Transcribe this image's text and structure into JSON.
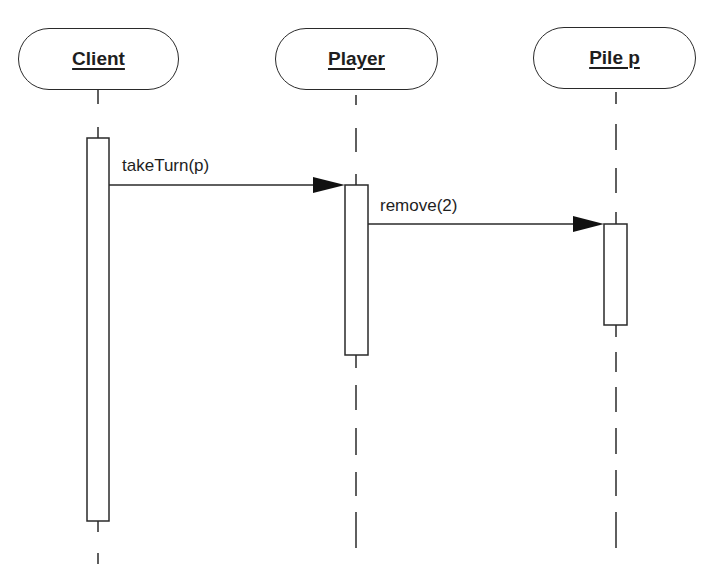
{
  "diagram": {
    "type": "uml-sequence-diagram",
    "actors": [
      {
        "id": "client",
        "label": "Client",
        "center_x": 98
      },
      {
        "id": "player",
        "label": "Player",
        "center_x": 356
      },
      {
        "id": "pile",
        "label": "Pile p",
        "center_x": 616
      }
    ],
    "messages": [
      {
        "from": "Client",
        "to": "Player",
        "label": "takeTurn(p)",
        "y": 185
      },
      {
        "from": "Player",
        "to": "Pile p",
        "label": "remove(2)",
        "y": 224
      }
    ],
    "activations": [
      {
        "actor": "Client",
        "top": 138,
        "bottom": 521
      },
      {
        "actor": "Player",
        "top": 185,
        "bottom": 355
      },
      {
        "actor": "Pile p",
        "top": 224,
        "bottom": 325
      }
    ],
    "colors": {
      "line": "#2a2a2a",
      "text": "#1e1e1e",
      "background": "#ffffff"
    }
  }
}
